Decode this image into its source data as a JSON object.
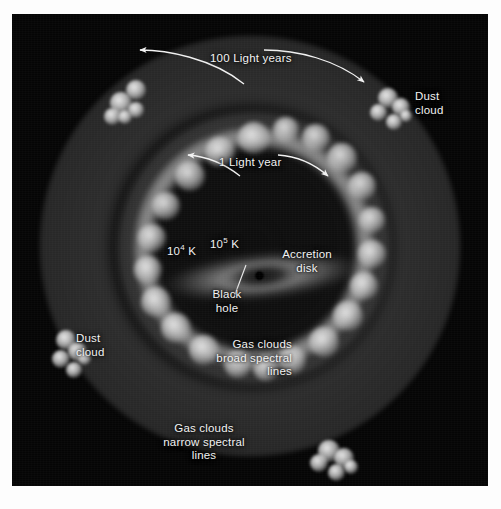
{
  "figure": {
    "background_color": "#050505",
    "label_color": "#f2f2f2"
  },
  "scale_labels": [
    {
      "name": "100-light-years",
      "text": "100 Light years"
    },
    {
      "name": "1-light-year",
      "text": "1 Light year"
    }
  ],
  "temperatures": [
    {
      "name": "outer-disk-temperature",
      "base": "10",
      "exponent": "4",
      "unit": " K"
    },
    {
      "name": "inner-disk-temperature",
      "base": "10",
      "exponent": "5",
      "unit": " K"
    }
  ],
  "components": {
    "accretion_disk": {
      "label": "Accretion",
      "label_line2": "disk"
    },
    "black_hole": {
      "label": "Black",
      "label_line2": "hole"
    },
    "broad_line_clouds": {
      "line1": "Gas clouds",
      "line2": "broad spectral",
      "line3": "lines"
    },
    "narrow_line_clouds": {
      "line1": "Gas clouds",
      "line2": "narrow spectral",
      "line3": "lines"
    },
    "dust_cloud_right": {
      "line1": "Dust",
      "line2": "cloud"
    },
    "dust_cloud_left": {
      "line1": "Dust",
      "line2": "cloud"
    }
  },
  "ring_knots": [
    {
      "cx": 134,
      "cy": 24,
      "r": 16
    },
    {
      "cx": 166,
      "cy": 16,
      "r": 13
    },
    {
      "cx": 100,
      "cy": 38,
      "r": 15
    },
    {
      "cx": 196,
      "cy": 24,
      "r": 14
    },
    {
      "cx": 70,
      "cy": 62,
      "r": 15
    },
    {
      "cx": 222,
      "cy": 44,
      "r": 15
    },
    {
      "cx": 46,
      "cy": 92,
      "r": 14
    },
    {
      "cx": 242,
      "cy": 72,
      "r": 14
    },
    {
      "cx": 32,
      "cy": 124,
      "r": 14
    },
    {
      "cx": 252,
      "cy": 106,
      "r": 13
    },
    {
      "cx": 28,
      "cy": 156,
      "r": 14
    },
    {
      "cx": 252,
      "cy": 140,
      "r": 14
    },
    {
      "cx": 36,
      "cy": 188,
      "r": 15
    },
    {
      "cx": 244,
      "cy": 172,
      "r": 14
    },
    {
      "cx": 56,
      "cy": 214,
      "r": 15
    },
    {
      "cx": 228,
      "cy": 202,
      "r": 15
    },
    {
      "cx": 84,
      "cy": 236,
      "r": 15
    },
    {
      "cx": 204,
      "cy": 228,
      "r": 15
    },
    {
      "cx": 118,
      "cy": 250,
      "r": 14
    },
    {
      "cx": 172,
      "cy": 246,
      "r": 14
    },
    {
      "cx": 146,
      "cy": 254,
      "r": 13
    }
  ],
  "dust_clouds": [
    {
      "name": "dust-cloud-upper-left",
      "x": 92,
      "y": 62,
      "blobs": [
        {
          "x": 6,
          "y": 16,
          "s": 22
        },
        {
          "x": 22,
          "y": 4,
          "s": 20
        },
        {
          "x": 0,
          "y": 32,
          "s": 17
        },
        {
          "x": 24,
          "y": 26,
          "s": 16
        },
        {
          "x": 14,
          "y": 34,
          "s": 14
        }
      ]
    },
    {
      "name": "dust-cloud-upper-right",
      "x": 356,
      "y": 66,
      "blobs": [
        {
          "x": 10,
          "y": 8,
          "s": 20
        },
        {
          "x": 24,
          "y": 18,
          "s": 18
        },
        {
          "x": 2,
          "y": 24,
          "s": 17
        },
        {
          "x": 18,
          "y": 34,
          "s": 16
        },
        {
          "x": 32,
          "y": 30,
          "s": 12
        }
      ]
    },
    {
      "name": "dust-cloud-left",
      "x": 38,
      "y": 312,
      "blobs": [
        {
          "x": 6,
          "y": 4,
          "s": 20
        },
        {
          "x": 18,
          "y": 16,
          "s": 19
        },
        {
          "x": 2,
          "y": 24,
          "s": 18
        },
        {
          "x": 16,
          "y": 36,
          "s": 16
        },
        {
          "x": 28,
          "y": 26,
          "s": 13
        }
      ]
    },
    {
      "name": "dust-cloud-lower-right",
      "x": 296,
      "y": 420,
      "blobs": [
        {
          "x": 10,
          "y": 6,
          "s": 22
        },
        {
          "x": 26,
          "y": 14,
          "s": 20
        },
        {
          "x": 2,
          "y": 20,
          "s": 18
        },
        {
          "x": 20,
          "y": 30,
          "s": 17
        },
        {
          "x": 36,
          "y": 26,
          "s": 14
        }
      ]
    }
  ]
}
